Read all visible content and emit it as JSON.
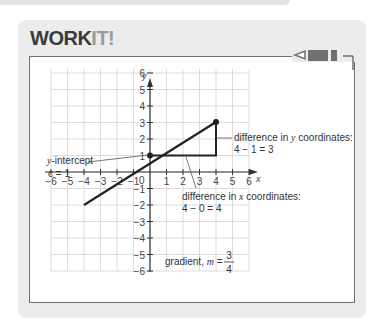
{
  "header": {
    "title_part1": "WORK",
    "title_part2": "IT!"
  },
  "icons": {
    "pencil": "pencil-icon"
  },
  "chart_data": {
    "type": "line",
    "title": "",
    "xlabel": "x",
    "ylabel": "y",
    "xlim": [
      -6,
      6
    ],
    "ylim": [
      -6,
      6
    ],
    "grid": true,
    "x_ticks": [
      "−6",
      "−5",
      "−4",
      "−3",
      "−2",
      "−1",
      "0",
      "1",
      "2",
      "3",
      "4",
      "5",
      "6"
    ],
    "y_ticks": [
      "6",
      "5",
      "4",
      "3",
      "2",
      "1",
      "−1",
      "−2",
      "−3",
      "−4",
      "−5",
      "−6"
    ],
    "series": [
      {
        "name": "line y = 3/4 x + 1",
        "x": [
          -4,
          4
        ],
        "y": [
          -2,
          4
        ]
      }
    ],
    "points": [
      {
        "x": 0,
        "y": 1
      },
      {
        "x": 4,
        "y": 4
      }
    ],
    "annotations": [
      {
        "text": "y-intercept",
        "text2": "c = 1",
        "target": [
          0,
          1
        ]
      },
      {
        "text": "difference in y coordinates:",
        "text2": "4 − 1 = 3"
      },
      {
        "text": "difference in x coordinates:",
        "text2": "4 − 0 = 4"
      },
      {
        "text": "gradient, m =",
        "numerator": "3",
        "denominator": "4"
      }
    ]
  },
  "labels": {
    "y_axis": "y",
    "x_axis": "x",
    "origin": "0",
    "y_intercept_line1": "-intercept",
    "y_intercept_var": "y",
    "y_intercept_line2": "c = 1",
    "diff_y_line1a": "difference in ",
    "diff_y_var": "y",
    "diff_y_line1b": " coordinates:",
    "diff_y_line2": "4 − 1 = 3",
    "diff_x_line1a": "difference in ",
    "diff_x_var": "x",
    "diff_x_line1b": " coordinates:",
    "diff_x_line2": "4 − 0 = 4",
    "gradient_label": "gradient, ",
    "gradient_var": "m",
    "gradient_eq": " =",
    "gradient_num": "3",
    "gradient_den": "4",
    "xt": [
      "−6",
      "−5",
      "−4",
      "−3",
      "−2",
      "−1",
      "1",
      "2",
      "3",
      "4",
      "5",
      "6"
    ],
    "yt": [
      "6",
      "5",
      "4",
      "3",
      "2",
      "1",
      "−1",
      "−2",
      "−3",
      "−4",
      "−5",
      "−6"
    ]
  }
}
